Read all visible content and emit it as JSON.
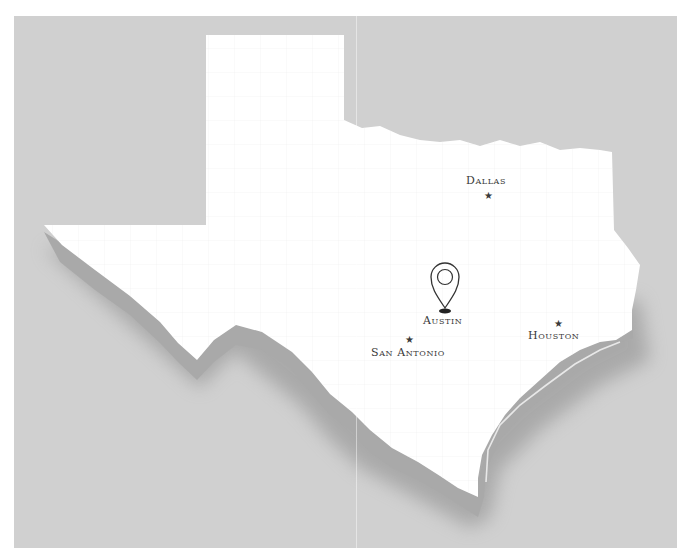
{
  "map": {
    "region": "Texas",
    "colors": {
      "background": "#d0d0d0",
      "land": "#ffffff",
      "extrusion": "#a8a8a8",
      "shadow": "#8f8f8f",
      "label": "#3a3a3a"
    },
    "cities": [
      {
        "name": "Dallas",
        "marker": "star",
        "label_x": 466,
        "label_y": 176,
        "marker_x": 484,
        "marker_y": 194
      },
      {
        "name": "Austin",
        "marker": "map-pin",
        "label_x": 423,
        "label_y": 316,
        "marker_x": 445,
        "marker_y": 262
      },
      {
        "name": "San Antonio",
        "marker": "star",
        "label_x": 371,
        "label_y": 348,
        "marker_x": 409,
        "marker_y": 338
      },
      {
        "name": "Houston",
        "marker": "star",
        "label_x": 528,
        "label_y": 331,
        "marker_x": 557,
        "marker_y": 322
      }
    ]
  }
}
